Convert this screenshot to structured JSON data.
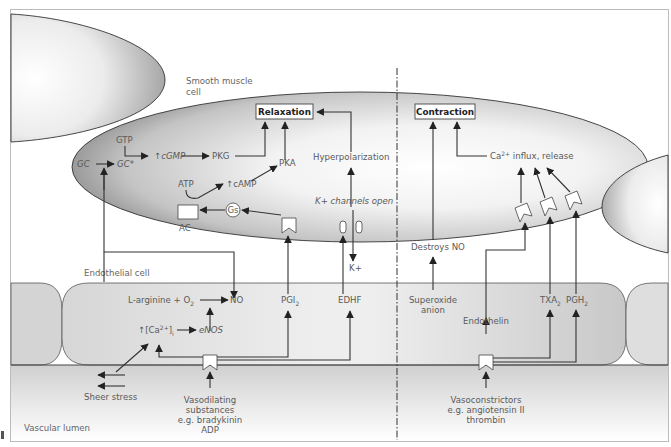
{
  "regions": {
    "smooth_muscle_cell": [
      "Smooth muscle",
      "cell"
    ],
    "endothelial_cell": "Endothelial cell",
    "vascular_lumen": "Vascular lumen"
  },
  "relaxation_side": {
    "outcome_box": "Relaxation",
    "smooth_muscle": {
      "gtp": "GTP",
      "gc": "GC",
      "gc_active": "GC*",
      "cgmp": "↑cGMP",
      "pkg": "PKG",
      "atp": "ATP",
      "camp": "↑cAMP",
      "pka": "PKA",
      "gs": "Gs",
      "ac": "AC",
      "hyperpolarization": "Hyperpolarization",
      "k_channels": "K+ channels open",
      "k_ion": "K+"
    },
    "endothelium": {
      "l_arginine": "L-arginine + O",
      "l_arginine_sub": "2",
      "no": "NO",
      "ca_prefix": "↑[Ca",
      "ca_sup": "2+",
      "ca_suffix": "]",
      "ca_sub": "i",
      "enos": "eNOS",
      "pgi": "PGI",
      "pgi_sub": "2",
      "edhf": "EDHF"
    },
    "lumen": {
      "sheer_stress": "Sheer stress",
      "vasodilating": [
        "Vasodilating",
        "substances",
        "e.g. bradykinin",
        "ADP"
      ]
    }
  },
  "contraction_side": {
    "outcome_box": "Contraction",
    "smooth_muscle": {
      "ca_influx_prefix": "Ca",
      "ca_influx_sup": "2+",
      "ca_influx_suffix": " influx, release",
      "destroys_no": "Destroys NO"
    },
    "endothelium": {
      "superoxide": [
        "Superoxide",
        "anion"
      ],
      "endothelin": "Endothelin",
      "txa": "TXA",
      "txa_sub": "2",
      "pgh": "PGH",
      "pgh_sub": "2"
    },
    "lumen": {
      "vasoconstrictors": [
        "Vasoconstrictors",
        "e.g. angiotensin II",
        "thrombin"
      ]
    }
  }
}
